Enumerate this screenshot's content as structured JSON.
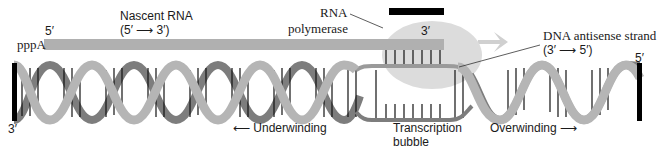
{
  "figure": {
    "colors": {
      "strand_light": "#b5b5b5",
      "strand_dark": "#7d7d7d",
      "rna": "#b0b0b0",
      "polymerase": "#dcdcdc",
      "end_bar": "#000000",
      "rung": "#111111"
    }
  },
  "labels": {
    "nascent_rna_title": "Nascent RNA",
    "nascent_rna_direction": "(5′ ⟶ 3′)",
    "rna_5prime": "5′",
    "rna_start": "pppA",
    "polymerase_line1": "RNA",
    "polymerase_line2": "polymerase",
    "rna_3prime": "3′",
    "antisense_title": "DNA antisense strand",
    "antisense_direction": "(3′ ⟶ 5′)",
    "dna_left_end": "3′",
    "dna_right_end": "5′",
    "underwinding": "⟵ Underwinding",
    "bubble_line1": "Transcription",
    "bubble_line2": "bubble",
    "overwinding": "Overwinding ⟶"
  }
}
